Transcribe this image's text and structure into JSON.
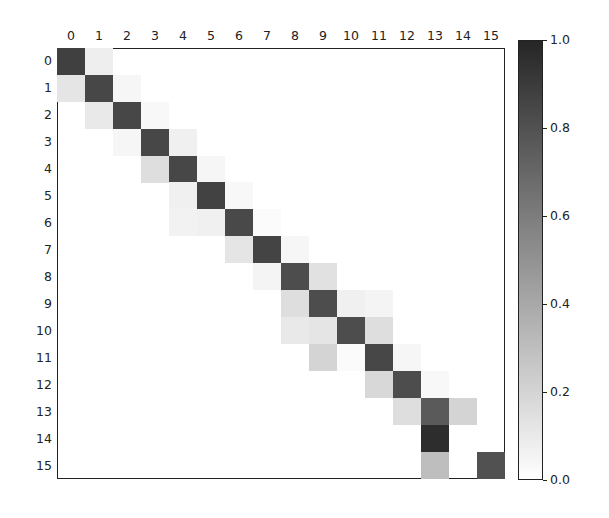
{
  "chart_data": {
    "type": "heatmap",
    "title": "",
    "xlabel": "",
    "ylabel": "",
    "x_ticks": [
      "0",
      "1",
      "2",
      "3",
      "4",
      "5",
      "6",
      "7",
      "8",
      "9",
      "10",
      "11",
      "12",
      "13",
      "14",
      "15"
    ],
    "y_ticks": [
      "0",
      "1",
      "2",
      "3",
      "4",
      "5",
      "6",
      "7",
      "8",
      "9",
      "10",
      "11",
      "12",
      "13",
      "14",
      "15"
    ],
    "x_axis_position": "top",
    "colormap": "gray_r",
    "vmin": 0.0,
    "vmax": 1.0,
    "colorbar_ticks": [
      "0.0",
      "0.2",
      "0.4",
      "0.6",
      "0.8",
      "1.0"
    ],
    "grid": false,
    "matrix": [
      [
        0.88,
        0.08,
        0,
        0,
        0,
        0,
        0,
        0,
        0,
        0,
        0,
        0,
        0,
        0,
        0,
        0
      ],
      [
        0.12,
        0.85,
        0.04,
        0,
        0,
        0,
        0,
        0,
        0,
        0,
        0,
        0,
        0,
        0,
        0,
        0
      ],
      [
        0,
        0.1,
        0.85,
        0.03,
        0,
        0,
        0,
        0,
        0,
        0,
        0,
        0,
        0,
        0,
        0,
        0
      ],
      [
        0,
        0,
        0.04,
        0.85,
        0.07,
        0,
        0,
        0,
        0,
        0,
        0,
        0,
        0,
        0,
        0,
        0
      ],
      [
        0,
        0,
        0,
        0.15,
        0.85,
        0.04,
        0,
        0,
        0,
        0,
        0,
        0,
        0,
        0,
        0,
        0
      ],
      [
        0,
        0,
        0,
        0,
        0.07,
        0.87,
        0.03,
        0,
        0,
        0,
        0,
        0,
        0,
        0,
        0,
        0
      ],
      [
        0,
        0,
        0,
        0,
        0.06,
        0.07,
        0.84,
        0.02,
        0,
        0,
        0,
        0,
        0,
        0,
        0,
        0
      ],
      [
        0,
        0,
        0,
        0,
        0,
        0,
        0.12,
        0.86,
        0.04,
        0,
        0,
        0,
        0,
        0,
        0,
        0
      ],
      [
        0,
        0,
        0,
        0,
        0,
        0,
        0,
        0.05,
        0.82,
        0.14,
        0,
        0,
        0,
        0,
        0,
        0
      ],
      [
        0,
        0,
        0,
        0,
        0,
        0,
        0,
        0,
        0.15,
        0.82,
        0.07,
        0.05,
        0,
        0,
        0,
        0
      ],
      [
        0,
        0,
        0,
        0,
        0,
        0,
        0,
        0,
        0.1,
        0.12,
        0.82,
        0.15,
        0,
        0,
        0,
        0
      ],
      [
        0,
        0,
        0,
        0,
        0,
        0,
        0,
        0,
        0,
        0.2,
        0.02,
        0.85,
        0.04,
        0,
        0,
        0
      ],
      [
        0,
        0,
        0,
        0,
        0,
        0,
        0,
        0,
        0,
        0,
        0,
        0.18,
        0.82,
        0.03,
        0,
        0
      ],
      [
        0,
        0,
        0,
        0,
        0,
        0,
        0,
        0,
        0,
        0,
        0,
        0,
        0.15,
        0.76,
        0.2,
        0
      ],
      [
        0,
        0,
        0,
        0,
        0,
        0,
        0,
        0,
        0,
        0,
        0,
        0,
        0,
        0.97,
        0,
        0
      ],
      [
        0,
        0,
        0,
        0,
        0,
        0,
        0,
        0,
        0,
        0,
        0,
        0,
        0,
        0.3,
        0,
        0.8
      ]
    ]
  }
}
